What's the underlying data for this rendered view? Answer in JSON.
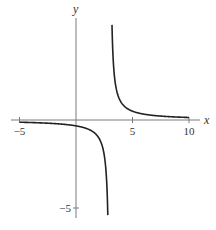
{
  "chart_data": {
    "type": "line",
    "title": "",
    "function": "y = 1/(x - 3)",
    "xlabel": "x",
    "ylabel": "y",
    "xlim": [
      -5,
      10
    ],
    "ylim": [
      -5.4,
      5.4
    ],
    "xticks": [
      -5,
      5,
      10
    ],
    "xtick_labels": [
      "−5",
      "5",
      "10"
    ],
    "yticks": [
      -5
    ],
    "ytick_labels": [
      "−5"
    ],
    "vertical_asymptote": 3,
    "horizontal_asymptote": 0,
    "grid": false,
    "series": [
      {
        "name": "left-branch",
        "x_range": [
          -5,
          2.815
        ],
        "values_sample": [
          [
            -5,
            -0.125
          ],
          [
            0,
            -0.333
          ],
          [
            2,
            -1
          ],
          [
            2.5,
            -2
          ],
          [
            2.815,
            -5.4
          ]
        ]
      },
      {
        "name": "right-branch",
        "x_range": [
          3.185,
          10
        ],
        "values_sample": [
          [
            3.185,
            5.4
          ],
          [
            3.5,
            2
          ],
          [
            4,
            1
          ],
          [
            5,
            0.5
          ],
          [
            10,
            0.143
          ]
        ]
      }
    ],
    "colors": {
      "axis": "#7a7a7a",
      "curve": "#222222"
    }
  }
}
